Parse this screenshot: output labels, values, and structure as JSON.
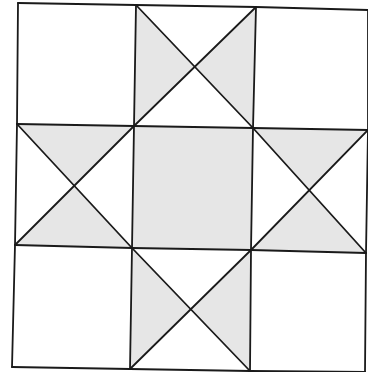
{
  "diagram": {
    "type": "quilt-block",
    "name": "Ohio Star (3x3 nine-patch with quarter-square triangles)",
    "colors": {
      "background": "#ffffff",
      "fill": "#e6e6e6",
      "stroke": "#1a1a1a"
    },
    "grid": {
      "rows": 4,
      "cols": 4,
      "points": [
        [
          [
            18,
            3
          ],
          [
            136,
            5
          ],
          [
            256,
            7
          ],
          [
            368,
            10
          ]
        ],
        [
          [
            17,
            124
          ],
          [
            134,
            126
          ],
          [
            253,
            128
          ],
          [
            368,
            130
          ]
        ],
        [
          [
            15,
            245
          ],
          [
            132,
            248
          ],
          [
            251,
            250
          ],
          [
            366,
            253
          ]
        ],
        [
          [
            12,
            367
          ],
          [
            130,
            369
          ],
          [
            250,
            371
          ],
          [
            365,
            372
          ]
        ]
      ]
    },
    "cells": [
      {
        "id": "top-left",
        "kind": "plain",
        "fill": "white"
      },
      {
        "id": "top-middle",
        "kind": "hourglass",
        "shaded": [
          "left",
          "right"
        ]
      },
      {
        "id": "top-right",
        "kind": "plain",
        "fill": "white"
      },
      {
        "id": "middle-left",
        "kind": "hourglass",
        "shaded": [
          "top",
          "bottom"
        ]
      },
      {
        "id": "center",
        "kind": "plain",
        "fill": "shaded"
      },
      {
        "id": "middle-right",
        "kind": "hourglass",
        "shaded": [
          "top",
          "bottom"
        ]
      },
      {
        "id": "bottom-left",
        "kind": "plain",
        "fill": "white"
      },
      {
        "id": "bottom-middle",
        "kind": "hourglass",
        "shaded": [
          "left",
          "right"
        ]
      },
      {
        "id": "bottom-right",
        "kind": "plain",
        "fill": "white"
      }
    ]
  }
}
